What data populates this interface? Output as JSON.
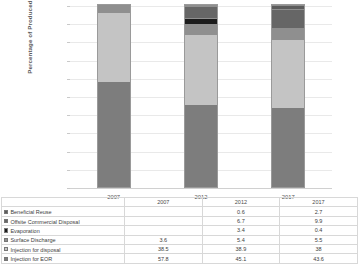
{
  "chart_data": {
    "type": "bar",
    "subtype": "stacked-bar-percent",
    "title": "",
    "xlabel": "",
    "ylabel": "Percentage of Produced Water",
    "categories": [
      "2007",
      "2012",
      "2017"
    ],
    "ylim": [
      0,
      100
    ],
    "yticks": [
      0,
      10,
      20,
      30,
      40,
      50,
      60,
      70,
      80,
      90,
      100
    ],
    "grid": true,
    "legend_position": "data-table-below",
    "stack_order_bottom_to_top": [
      "Injection for EOR",
      "Injection for disposal",
      "Surface Discharge",
      "Evaporation",
      "Offsite Commercial Disposal",
      "Beneficial Reuse"
    ],
    "series": [
      {
        "name": "Beneficial Reuse",
        "color": "#5c5c5c",
        "values": [
          null,
          0.6,
          2.7
        ]
      },
      {
        "name": "Offsite Commercial Disposal",
        "color": "#666666",
        "values": [
          null,
          6.7,
          9.9
        ]
      },
      {
        "name": "Evaporation",
        "color": "#1c1c1c",
        "values": [
          null,
          3.4,
          0.4
        ]
      },
      {
        "name": "Surface Discharge",
        "color": "#8f8f8f",
        "values": [
          3.6,
          5.4,
          5.5
        ]
      },
      {
        "name": "Injection for disposal",
        "color": "#c4c4c4",
        "values": [
          38.5,
          38.9,
          38
        ]
      },
      {
        "name": "Injection for EOR",
        "color": "#7d7d7d",
        "values": [
          57.8,
          45.1,
          43.6
        ]
      }
    ]
  },
  "axis": {
    "y_title": "Percentage of Produced Water",
    "y_tick_labels": [
      "0",
      "10",
      "20",
      "30",
      "40",
      "50",
      "60",
      "70",
      "80",
      "90",
      "100"
    ],
    "x_tick_labels": [
      "2007",
      "2012",
      "2017"
    ]
  },
  "table": {
    "header": [
      "",
      "2007",
      "2012",
      "2017"
    ],
    "rows": [
      {
        "label": "Beneficial Reuse",
        "swatch": "#5c5c5c",
        "values": [
          "",
          "0.6",
          "2.7"
        ]
      },
      {
        "label": "Offsite Commercial Disposal",
        "swatch": "#666666",
        "values": [
          "",
          "6.7",
          "9.9"
        ]
      },
      {
        "label": "Evaporation",
        "swatch": "#1c1c1c",
        "values": [
          "",
          "3.4",
          "0.4"
        ]
      },
      {
        "label": "Surface Discharge",
        "swatch": "#8f8f8f",
        "values": [
          "3.6",
          "5.4",
          "5.5"
        ]
      },
      {
        "label": "Injection for disposal",
        "swatch": "#c4c4c4",
        "values": [
          "38.5",
          "38.9",
          "38"
        ]
      },
      {
        "label": "Injection for EOR",
        "swatch": "#7d7d7d",
        "values": [
          "57.8",
          "45.1",
          "43.6"
        ]
      }
    ]
  }
}
